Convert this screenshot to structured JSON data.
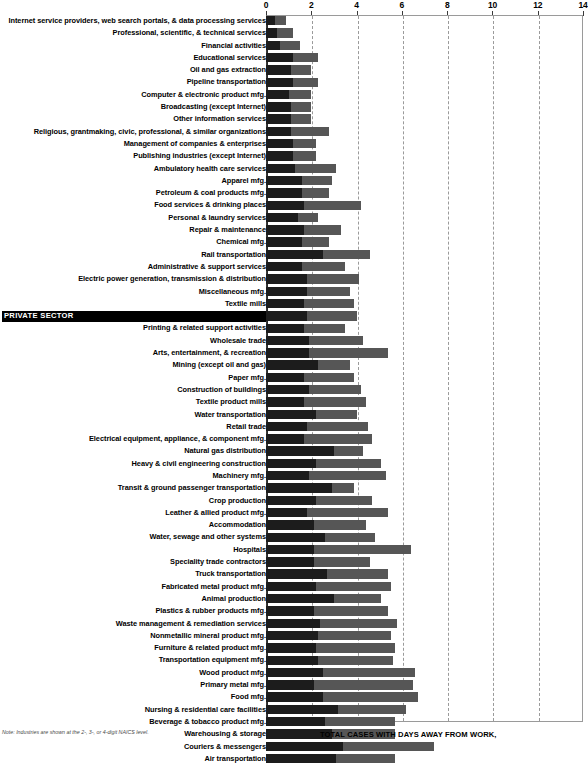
{
  "chart_data": {
    "type": "bar",
    "subtype": "stacked-horizontal",
    "title": "",
    "xlabel": "",
    "ylabel": "",
    "xlim": [
      0,
      14
    ],
    "xticks": [
      0,
      2,
      4,
      6,
      8,
      10,
      12,
      14
    ],
    "grid": true,
    "legend_position": "bottom-right",
    "series": [
      {
        "name": "TOTAL CASES WITH DAYS AWAY FROM WORK,",
        "color": "#1c1c1c"
      },
      {
        "name": "JOB TRANSFER, OR RESTRICTION",
        "color": "#565656"
      }
    ],
    "categories": [
      "Internet service providers, web search portals, & data processing services",
      "Professional, scientific, & technical services",
      "Financial activities",
      "Educational services",
      "Oil and gas extraction",
      "Pipeline transportation",
      "Computer & electronic product mfg.",
      "Broadcasting (except Internet)",
      "Other information services",
      "Religious, grantmaking, civic, professional, & similar organizations",
      "Management of companies & enterprises",
      "Publishing industries (except Internet)",
      "Ambulatory health care services",
      "Apparel mfg.",
      "Petroleum & coal products mfg.",
      "Food services & drinking places",
      "Personal & laundry services",
      "Repair & maintenance",
      "Chemical mfg.",
      "Rail transportation",
      "Administrative & support services",
      "Electric power generation, transmission & distribution",
      "Miscellaneous mfg.",
      "Textile mills",
      "PRIVATE SECTOR",
      "Printing & related support activities",
      "Wholesale trade",
      "Arts, entertainment, & recreation",
      "Mining (except oil and gas)",
      "Paper mfg.",
      "Construction of buildings",
      "Textile product mills",
      "Water transportation",
      "Retail trade",
      "Electrical equipment, appliance, & component mfg.",
      "Natural gas distribution",
      "Heavy & civil engineering construction",
      "Machinery mfg.",
      "Transit & ground passenger transportation",
      "Crop production",
      "Leather & allied product mfg.",
      "Accommodation",
      "Water, sewage and other systems",
      "Hospitals",
      "Speciality trade contractors",
      "Truck transportation",
      "Fabricated metal product mfg.",
      "Animal production",
      "Plastics & rubber products mfg.",
      "Waste management & remediation services",
      "Nonmetallic mineral product mfg.",
      "Furniture & related product mfg.",
      "Transportation equipment mfg.",
      "Wood product mfg.",
      "Primary metal mfg.",
      "Food mfg.",
      "Nursing & residential care facilities",
      "Beverage & tobacco product mfg.",
      "Warehousing & storage",
      "Couriers & messengers",
      "Air transportation"
    ],
    "highlight_category": "PRIVATE SECTOR",
    "values_series_1": [
      0.4,
      0.5,
      0.6,
      1.2,
      1.1,
      1.2,
      1.0,
      1.1,
      1.1,
      1.1,
      1.2,
      1.2,
      1.3,
      1.6,
      1.6,
      1.7,
      1.4,
      1.7,
      1.6,
      2.5,
      1.6,
      1.8,
      1.8,
      1.7,
      1.8,
      1.7,
      1.9,
      1.9,
      2.3,
      1.7,
      1.9,
      1.7,
      2.2,
      1.8,
      1.7,
      3.0,
      2.2,
      1.9,
      2.9,
      2.2,
      1.8,
      2.1,
      2.6,
      2.1,
      2.1,
      2.7,
      2.2,
      3.0,
      2.1,
      2.4,
      2.3,
      2.2,
      2.3,
      2.5,
      2.1,
      2.5,
      3.2,
      2.6,
      2.9,
      3.4,
      3.1
    ],
    "values_series_2": [
      0.5,
      0.7,
      0.9,
      1.1,
      0.9,
      1.1,
      1.0,
      0.9,
      0.9,
      1.7,
      1.0,
      1.0,
      1.8,
      1.3,
      1.2,
      2.5,
      0.9,
      1.6,
      1.2,
      2.1,
      1.9,
      2.3,
      1.9,
      2.2,
      2.2,
      1.8,
      2.4,
      3.5,
      1.4,
      2.2,
      2.3,
      2.7,
      1.8,
      2.7,
      3.0,
      1.3,
      2.9,
      3.4,
      1.0,
      2.5,
      3.6,
      2.3,
      2.2,
      4.3,
      2.5,
      2.7,
      3.3,
      2.1,
      3.3,
      3.4,
      3.2,
      3.5,
      3.3,
      4.1,
      4.4,
      4.2,
      3.0,
      3.1,
      2.8,
      4.0,
      2.6
    ]
  },
  "axis": {
    "ticks": [
      "0",
      "2",
      "4",
      "6",
      "8",
      "10",
      "12",
      "14"
    ]
  },
  "footer": {
    "note": "Note: Industries are shown at the 2-, 3-, or 4-digit NAICS level.",
    "legend_label": "TOTAL CASES WITH DAYS AWAY FROM WORK,"
  }
}
